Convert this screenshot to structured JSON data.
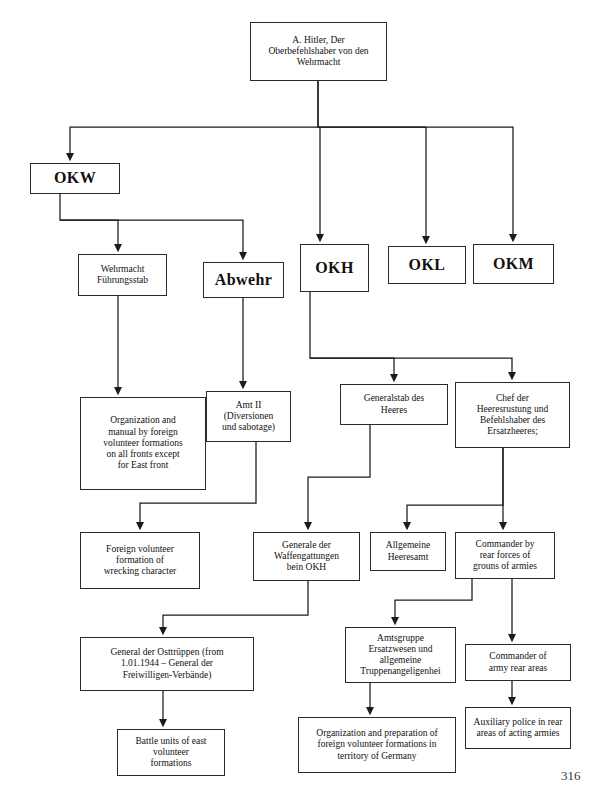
{
  "document": {
    "page_number": "316",
    "kind": "organizational-chart"
  },
  "chart_data": {
    "type": "diagram",
    "title": "",
    "nodes": [
      {
        "id": "hitler",
        "label": "A. Hitler, Der\nOberbefehlshaber von den\nWehrmacht",
        "style": "plain",
        "x": 250,
        "y": 22,
        "w": 137,
        "h": 59
      },
      {
        "id": "okw",
        "label": "OKW",
        "style": "bold",
        "x": 30,
        "y": 163,
        "w": 90,
        "h": 31
      },
      {
        "id": "wehrmacht_fuehrungsstab",
        "label": "Wehrmacht\nFührungsstab",
        "style": "plain",
        "x": 78,
        "y": 254,
        "w": 89,
        "h": 42
      },
      {
        "id": "abwehr",
        "label": "Abwehr",
        "style": "bold",
        "x": 203,
        "y": 262,
        "w": 81,
        "h": 36
      },
      {
        "id": "okh",
        "label": "OKH",
        "style": "bold",
        "x": 300,
        "y": 244,
        "w": 69,
        "h": 48
      },
      {
        "id": "okl",
        "label": "OKL",
        "style": "bold",
        "x": 388,
        "y": 246,
        "w": 78,
        "h": 38
      },
      {
        "id": "okm",
        "label": "OKM",
        "style": "bold",
        "x": 473,
        "y": 244,
        "w": 81,
        "h": 40
      },
      {
        "id": "org_manual_foreign",
        "label": "Organization and\nmanual by foreign\nvolunteer formations\non all fronts except\nfor East front",
        "style": "plain",
        "x": 80,
        "y": 397,
        "w": 126,
        "h": 93
      },
      {
        "id": "amt_ii",
        "label": "Amt II\n(Diversionen\nund sabotage)",
        "style": "plain",
        "x": 206,
        "y": 391,
        "w": 85,
        "h": 51
      },
      {
        "id": "generalstab",
        "label": "Generalstab des\nHeeres",
        "style": "plain",
        "x": 340,
        "y": 384,
        "w": 108,
        "h": 41
      },
      {
        "id": "chef_heeresrustung",
        "label": "Chef der\nHeeresrustung und\nBefehlshaber des\nErsatzheeres;",
        "style": "plain",
        "x": 455,
        "y": 382,
        "w": 115,
        "h": 66
      },
      {
        "id": "foreign_wrecking",
        "label": "Foreign volunteer\nformation of\nwrecking character",
        "style": "plain",
        "x": 80,
        "y": 532,
        "w": 120,
        "h": 57
      },
      {
        "id": "generale_waffengattungen",
        "label": "Generale der\nWaffengattungen\nbein OKH",
        "style": "plain",
        "x": 253,
        "y": 532,
        "w": 107,
        "h": 49
      },
      {
        "id": "allgemeine_heeresamt",
        "label": "Allgemeine\nHeeresamt",
        "style": "plain",
        "x": 370,
        "y": 532,
        "w": 76,
        "h": 39
      },
      {
        "id": "commander_rear_forces",
        "label": "Commander by\nrear forces of\ngrouns of armies",
        "style": "plain",
        "x": 455,
        "y": 532,
        "w": 100,
        "h": 47
      },
      {
        "id": "general_osttruppen",
        "label": "General der Osttrüppen (from\n1.01.1944 – General der\nFreiwilligen-Verbände)",
        "style": "plain",
        "x": 80,
        "y": 637,
        "w": 174,
        "h": 54
      },
      {
        "id": "amtsgruppe",
        "label": "Amtsgruppe\nErsatzwesen und\nallgemeine\nTruppenangeligenhei",
        "style": "plain",
        "x": 345,
        "y": 627,
        "w": 111,
        "h": 56
      },
      {
        "id": "commander_army_rear",
        "label": "Commander of\narmy rear areas",
        "style": "plain",
        "x": 465,
        "y": 644,
        "w": 106,
        "h": 37
      },
      {
        "id": "battle_units",
        "label": "Battle units of east\nvolunteer\nformations",
        "style": "plain",
        "x": 117,
        "y": 729,
        "w": 108,
        "h": 47
      },
      {
        "id": "org_prep_germany",
        "label": "Organization and preparation of\nforeign volunteer formations in\nterritory of Germany",
        "style": "plain",
        "x": 298,
        "y": 717,
        "w": 158,
        "h": 56
      },
      {
        "id": "auxiliary_police",
        "label": "Auxiliary police in rear\nareas of acting armies",
        "style": "plain",
        "x": 465,
        "y": 707,
        "w": 106,
        "h": 42
      }
    ],
    "edges": [
      {
        "from": "hitler",
        "to": "okw",
        "path": "M 318 81 L 318 127 L 70 127 L 70 157",
        "arrow": true
      },
      {
        "from": "hitler",
        "to": "okh",
        "path": "M 318 81 L 318 127 L 320 127 L 320 238",
        "arrow": true
      },
      {
        "from": "hitler",
        "to": "okl",
        "path": "M 318 127 L 426 127 L 426 240",
        "arrow": true
      },
      {
        "from": "hitler",
        "to": "okm",
        "path": "M 318 127 L 513 127 L 513 238",
        "arrow": true
      },
      {
        "from": "okw",
        "to": "wehrmacht_fuehrungsstab",
        "path": "M 60 194 L 60 220 L 118 220 L 118 248",
        "arrow": true
      },
      {
        "from": "okw",
        "to": "abwehr",
        "path": "M 60 220 L 243 220 L 243 256",
        "arrow": true
      },
      {
        "from": "wehrmacht_fuehrungsstab",
        "to": "org_manual_foreign",
        "path": "M 118 296 L 118 391",
        "arrow": true
      },
      {
        "from": "abwehr",
        "to": "amt_ii",
        "path": "M 243 298 L 243 385",
        "arrow": true
      },
      {
        "from": "okh",
        "to": "generalstab",
        "path": "M 310 292 L 310 358 L 394 358 L 394 378",
        "arrow": true
      },
      {
        "from": "okh",
        "to": "chef_heeresrustung",
        "path": "M 310 358 L 512 358 L 512 376",
        "arrow": true
      },
      {
        "from": "amt_ii",
        "to": "foreign_wrecking",
        "path": "M 256 442 L 256 503 L 140 503 L 140 526",
        "arrow": true
      },
      {
        "from": "generalstab",
        "to": "generale_waffengattungen",
        "path": "M 370 425 L 370 477 L 308 477 L 308 526",
        "arrow": true
      },
      {
        "from": "chef_heeresrustung",
        "to": "allgemeine_heeresamt",
        "path": "M 503 448 L 503 505 L 407 505 L 407 526",
        "arrow": true
      },
      {
        "from": "chef_heeresrustung",
        "to": "commander_rear_forces",
        "path": "M 503 448 L 503 526",
        "arrow": true
      },
      {
        "from": "generale_waffengattungen",
        "to": "general_osttruppen",
        "path": "M 308 581 L 308 615 L 163 615 L 163 631",
        "arrow": true
      },
      {
        "from": "commander_rear_forces",
        "to": "amtsgruppe",
        "path": "M 472 579 L 472 600 L 395 600 L 395 621",
        "arrow": true
      },
      {
        "from": "commander_rear_forces",
        "to": "commander_army_rear",
        "path": "M 512 579 L 512 638",
        "arrow": true
      },
      {
        "from": "general_osttruppen",
        "to": "battle_units",
        "path": "M 163 691 L 163 723",
        "arrow": true
      },
      {
        "from": "amtsgruppe",
        "to": "org_prep_germany",
        "path": "M 370 683 L 370 711",
        "arrow": true
      },
      {
        "from": "commander_army_rear",
        "to": "auxiliary_police",
        "path": "M 512 681 L 512 701",
        "arrow": true
      }
    ]
  }
}
